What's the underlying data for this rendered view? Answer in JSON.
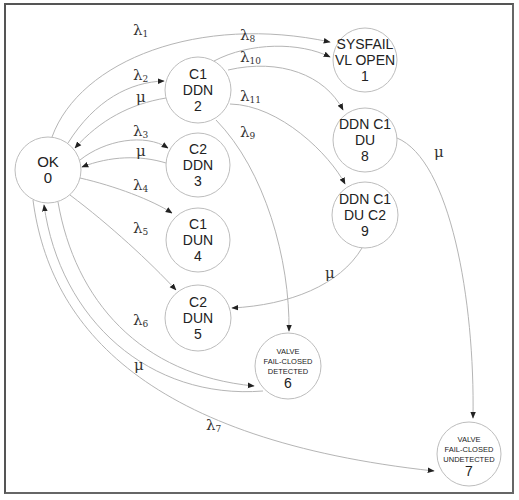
{
  "diagram": {
    "type": "state-transition (Markov) diagram",
    "nodes": [
      {
        "id": "0",
        "lines": [
          "OK",
          "0"
        ],
        "x": 48,
        "y": 170,
        "r": 33,
        "size": 15
      },
      {
        "id": "2",
        "lines": [
          "C1",
          "DDN",
          "2"
        ],
        "x": 198,
        "y": 90,
        "r": 33,
        "size": 14
      },
      {
        "id": "3",
        "lines": [
          "C2",
          "DDN",
          "3"
        ],
        "x": 198,
        "y": 165,
        "r": 32,
        "size": 14
      },
      {
        "id": "4",
        "lines": [
          "C1",
          "DUN",
          "4"
        ],
        "x": 198,
        "y": 240,
        "r": 32,
        "size": 14
      },
      {
        "id": "5",
        "lines": [
          "C2",
          "DUN",
          "5"
        ],
        "x": 198,
        "y": 318,
        "r": 33,
        "size": 14
      },
      {
        "id": "1",
        "lines": [
          "SYSFAIL",
          "VL OPEN",
          "1"
        ],
        "x": 365,
        "y": 60,
        "r": 32,
        "size": 14
      },
      {
        "id": "8",
        "lines": [
          "DDN C1",
          "DU",
          "8"
        ],
        "x": 365,
        "y": 140,
        "r": 32,
        "size": 14
      },
      {
        "id": "9",
        "lines": [
          "DDN C1",
          "DU C2",
          "9"
        ],
        "x": 365,
        "y": 215,
        "r": 33,
        "size": 14
      },
      {
        "id": "6",
        "lines": [
          "VALVE",
          "FAIL-CLOSED",
          "DETECTED",
          "6"
        ],
        "x": 288,
        "y": 366,
        "r": 33,
        "size": 7.5
      },
      {
        "id": "7",
        "lines": [
          "VALVE",
          "FAIL-CLOSED",
          "UNDETECTED",
          "7"
        ],
        "x": 469,
        "y": 454,
        "r": 32,
        "size": 7.5
      }
    ],
    "edges": [
      {
        "from": "0",
        "to": "1",
        "label": "λ",
        "sub": "1"
      },
      {
        "from": "0",
        "to": "2",
        "label": "λ",
        "sub": "2"
      },
      {
        "from": "2",
        "to": "0",
        "label": "μ",
        "sub": ""
      },
      {
        "from": "0",
        "to": "3",
        "label": "λ",
        "sub": "3"
      },
      {
        "from": "3",
        "to": "0",
        "label": "μ",
        "sub": ""
      },
      {
        "from": "0",
        "to": "4",
        "label": "λ",
        "sub": "4"
      },
      {
        "from": "0",
        "to": "5",
        "label": "λ",
        "sub": "5"
      },
      {
        "from": "0",
        "to": "6",
        "label": "λ",
        "sub": "6"
      },
      {
        "from": "6",
        "to": "0",
        "label": "μ",
        "sub": ""
      },
      {
        "from": "0",
        "to": "7",
        "label": "λ",
        "sub": "7"
      },
      {
        "from": "2",
        "to": "1",
        "label": "λ",
        "sub": "8"
      },
      {
        "from": "2",
        "to": "6",
        "label": "λ",
        "sub": "9"
      },
      {
        "from": "2",
        "to": "8",
        "label": "λ",
        "sub": "10"
      },
      {
        "from": "2",
        "to": "9",
        "label": "λ",
        "sub": "11"
      },
      {
        "from": "8",
        "to": "7",
        "label": "μ",
        "sub": ""
      },
      {
        "from": "9",
        "to": "5",
        "label": "μ",
        "sub": ""
      }
    ]
  }
}
